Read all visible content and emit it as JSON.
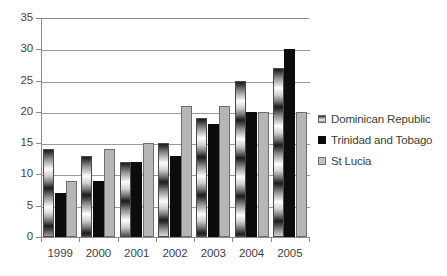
{
  "chart_data": {
    "type": "bar",
    "title": "",
    "xlabel": "",
    "ylabel": "",
    "categories": [
      "1999",
      "2000",
      "2001",
      "2002",
      "2003",
      "2004",
      "2005"
    ],
    "series": [
      {
        "name": "Dominican Republic",
        "values": [
          14,
          13,
          12,
          15,
          19,
          25,
          27
        ],
        "color": "#8d8d8d",
        "pattern": "gradient-bands"
      },
      {
        "name": "Trinidad and Tobago",
        "values": [
          7,
          9,
          12,
          13,
          18,
          20,
          30
        ],
        "color": "#0c0c0c",
        "pattern": "solid"
      },
      {
        "name": "St Lucia",
        "values": [
          9,
          14,
          15,
          21,
          21,
          20,
          20
        ],
        "color": "#b6b6b6",
        "pattern": "solid"
      }
    ],
    "ylim": [
      0,
      35
    ],
    "ytick_step": 5,
    "yticks": [
      "0",
      "5",
      "10",
      "15",
      "20",
      "25",
      "30",
      "35"
    ],
    "grid": true,
    "grid_axis": "y",
    "legend_position": "right"
  },
  "legend": {
    "entries": [
      {
        "label": "Dominican Republic"
      },
      {
        "label": "Trinidad and Tobago"
      },
      {
        "label": "St Lucia"
      }
    ]
  }
}
